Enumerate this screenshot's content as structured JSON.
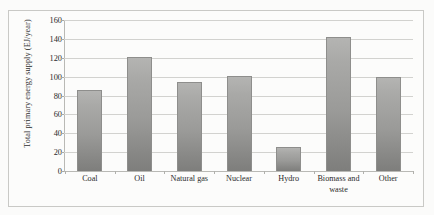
{
  "chart_data": {
    "type": "bar",
    "title": "",
    "xlabel": "",
    "ylabel": "Total primary energy supply (EJ/year)",
    "categories": [
      "Coal",
      "Oil",
      "Natural gas",
      "Nuclear",
      "Hydro",
      "Biomass and waste",
      "Other"
    ],
    "values": [
      86,
      121,
      94,
      101,
      25,
      142,
      100
    ],
    "ylim": [
      0,
      160
    ],
    "ytick_step": 20,
    "yticks": [
      0,
      20,
      40,
      60,
      80,
      100,
      120,
      140,
      160
    ],
    "ytick_labels": [
      "0",
      "20",
      "40",
      "60",
      "80",
      "100",
      "120",
      "140",
      "160"
    ],
    "grid": "horizontal",
    "legend": "none",
    "series": [
      {
        "name": "Total primary energy supply",
        "values": [
          86,
          121,
          94,
          101,
          25,
          142,
          100
        ]
      }
    ],
    "colors": {
      "bar_fill_top": "#b4b4b2",
      "bar_fill_bottom": "#7e7e7c",
      "bar_border": "#8e8e8c",
      "gridline": "#d2d2cf",
      "axis": "#b9b9b5",
      "background": "#fcfcfb",
      "text": "#2b2b2b"
    }
  }
}
